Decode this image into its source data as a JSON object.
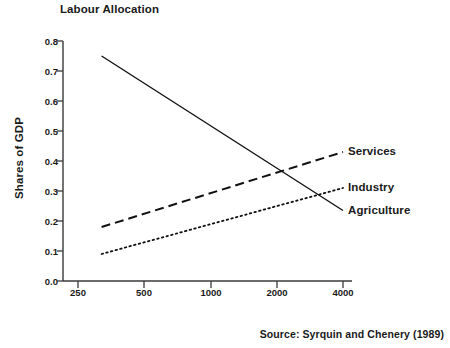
{
  "chart_data": {
    "type": "line",
    "title": "Labour Allocation",
    "xlabel": "GNP Per Capita (1980 US dollars)",
    "ylabel": "Shares of GDP",
    "xscale": "log",
    "xlim": [
      250,
      4000
    ],
    "ylim": [
      0.0,
      0.8
    ],
    "xticks": [
      250,
      500,
      1000,
      2000,
      4000
    ],
    "xtick_labels": [
      "250",
      "500",
      "1000",
      "2000",
      "4000"
    ],
    "yticks": [
      0.0,
      0.1,
      0.2,
      0.3,
      0.4,
      0.5,
      0.6,
      0.7,
      0.8
    ],
    "ytick_labels": [
      "0.0",
      "0.1",
      "0.2",
      "0.3",
      "0.4",
      "0.5",
      "0.6",
      "0.7",
      "0.8"
    ],
    "grid": false,
    "legend": "inline-right-labels",
    "series": [
      {
        "name": "Agriculture",
        "style": "solid",
        "color": "#111111",
        "x": [
          320,
          4000
        ],
        "y": [
          0.75,
          0.235
        ]
      },
      {
        "name": "Services",
        "style": "dashed",
        "color": "#111111",
        "x": [
          320,
          4000
        ],
        "y": [
          0.18,
          0.43
        ]
      },
      {
        "name": "Industry",
        "style": "dotted",
        "color": "#111111",
        "x": [
          320,
          4000
        ],
        "y": [
          0.09,
          0.31
        ]
      }
    ],
    "annotations": [
      {
        "text": "Services",
        "x": 4000,
        "y": 0.43
      },
      {
        "text": "Industry",
        "x": 4000,
        "y": 0.31
      },
      {
        "text": "Agriculture",
        "x": 4000,
        "y": 0.235
      }
    ],
    "source": "Source: Syrquin and Chenery (1989)"
  },
  "axes": {
    "y_labels": [
      "0.8",
      "0.7",
      "0.6",
      "0.5",
      "0.4",
      "0.3",
      "0.2",
      "0.1",
      "0.0"
    ],
    "y_tops": [
      37,
      67,
      97,
      127,
      157,
      187,
      217,
      247,
      277
    ],
    "x_labels": [
      "250",
      "500",
      "1000",
      "2000",
      "4000"
    ],
    "x_lefts": [
      78,
      144,
      211,
      277,
      343
    ]
  },
  "series_labels": [
    {
      "text": "Services",
      "left": 348,
      "top": 145
    },
    {
      "text": "Industry",
      "left": 348,
      "top": 181
    },
    {
      "text": "Agriculture",
      "left": 348,
      "top": 204
    }
  ]
}
